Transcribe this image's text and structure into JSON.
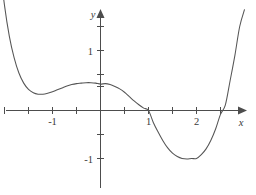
{
  "chart_data": {
    "type": "line",
    "title": "",
    "subtitle": "",
    "xlabel": "x",
    "ylabel": "y",
    "xlim": [
      -2.15,
      3.05
    ],
    "ylim": [
      -1.72,
      2.15
    ],
    "grid": false,
    "legend": null,
    "x_ticks": [
      -2.0,
      -1.5,
      -1.0,
      -0.5,
      0.5,
      1.0,
      1.5,
      2.0,
      2.5,
      3.0
    ],
    "x_tick_labels": [
      "",
      "",
      "-1",
      "",
      "",
      "1",
      "",
      "2",
      "",
      ""
    ],
    "y_ticks": [
      -1.5,
      -1.0,
      -0.5,
      0.5,
      1.0,
      1.5,
      2.0
    ],
    "y_tick_labels": [
      "",
      "-1",
      "",
      "",
      "1",
      "",
      ""
    ],
    "axis_origin": [
      0,
      0
    ],
    "series": [
      {
        "name": "curve",
        "color": "#555555",
        "x": [
          -2.1,
          -2.0,
          -1.9,
          -1.8,
          -1.7,
          -1.6,
          -1.5,
          -1.4,
          -1.3,
          -1.2,
          -1.1,
          -1.0,
          -0.9,
          -0.8,
          -0.7,
          -0.6,
          -0.5,
          -0.4,
          -0.3,
          -0.2,
          -0.1,
          0.0,
          0.1,
          0.2,
          0.3,
          0.4,
          0.5,
          0.6,
          0.7,
          0.8,
          0.9,
          1.0,
          1.1,
          1.2,
          1.3,
          1.4,
          1.5,
          1.6,
          1.7,
          1.8,
          1.9,
          2.0,
          2.1,
          2.2,
          2.3,
          2.4,
          2.5,
          2.6,
          2.7,
          2.8,
          2.9,
          3.0
        ],
        "y": [
          3.05,
          2.19,
          1.55,
          1.1,
          0.78,
          0.57,
          0.44,
          0.37,
          0.34,
          0.34,
          0.36,
          0.39,
          0.43,
          0.47,
          0.51,
          0.54,
          0.56,
          0.57,
          0.58,
          0.58,
          0.57,
          0.55,
          0.56,
          0.54,
          0.5,
          0.45,
          0.38,
          0.29,
          0.2,
          0.12,
          0.05,
          0.0,
          -0.25,
          -0.45,
          -0.63,
          -0.78,
          -0.89,
          -0.96,
          -1.0,
          -1.01,
          -1.0,
          -1.0,
          -0.92,
          -0.8,
          -0.62,
          -0.38,
          -0.08,
          0.11,
          0.62,
          1.15,
          1.75,
          2.1
        ]
      }
    ],
    "features": {
      "local_min_left": {
        "x": -1.2,
        "y": 0.34
      },
      "local_max": {
        "x": 0.1,
        "y": 0.56
      },
      "root_1": {
        "x": 1.0,
        "y": 0.0
      },
      "global_min": {
        "x": 2.0,
        "y": -1.0
      },
      "root_2": {
        "x": 2.62,
        "y": 0.0
      }
    }
  },
  "axes": {
    "x_axis_label": "x",
    "y_axis_label": "y",
    "x_labels": [
      {
        "text": "-1",
        "value": -1
      },
      {
        "text": "1",
        "value": 1
      },
      {
        "text": "2",
        "value": 2
      }
    ],
    "y_labels": [
      {
        "text": "1",
        "value": 1
      },
      {
        "text": "-1",
        "value": -1
      }
    ]
  },
  "colors": {
    "curve": "#555555",
    "axis": "#4d4d4d",
    "text": "#3a3a3a",
    "background": "#ffffff"
  }
}
